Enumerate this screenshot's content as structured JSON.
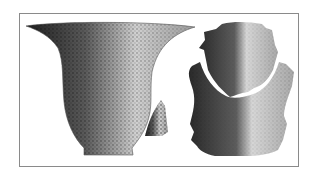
{
  "figure": {
    "items": [
      {
        "name": "flared-bowl",
        "description": "large flared-rim vessel with ring base"
      },
      {
        "name": "sherd-fragment",
        "description": "small rim/body fragment"
      },
      {
        "name": "reconstructed-vessel",
        "description": "two-part vessel with upper and lower sections"
      }
    ],
    "colors": {
      "frame": "#8a8a8a",
      "background": "#ffffff",
      "ink_dark": "#1e1e1e",
      "ink_mid": "#6e6e6e",
      "ink_light": "#d8d8d8"
    }
  }
}
